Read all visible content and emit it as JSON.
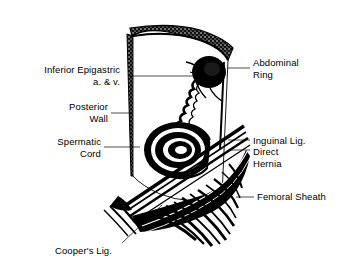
{
  "figure": {
    "background": "#ffffff",
    "ink": "#000000"
  },
  "labels": {
    "inferior_epigastric": "Inferior Epigastric\na. & v.",
    "posterior_wall": "Posterior\nWall",
    "spermatic_cord": "Spermatic\nCord",
    "abdominal_ring": "Abdominal\nRing",
    "inguinal_lig": "Inguinal Lig.",
    "direct_hernia": "Direct\nHernia",
    "femoral_sheath": "Femoral Sheath",
    "coopers_lig": "Cooper's Lig."
  },
  "structures": [
    {
      "name": "posterior-wall-panel",
      "description": "cut abdominal wall flap with stippled cut edge"
    },
    {
      "name": "abdominal-ring",
      "description": "dark filled oval aperture in upper wall"
    },
    {
      "name": "inferior-epigastric-vessels",
      "description": "wavy vessel pair running down the wall"
    },
    {
      "name": "direct-hernia-bulge",
      "description": "concentric swirl below the ring"
    },
    {
      "name": "inguinal-ligament",
      "description": "diagonal banded cord crossing the field"
    },
    {
      "name": "femoral-sheath",
      "description": "fan of fibrous striations lower right"
    },
    {
      "name": "coopers-ligament",
      "description": "pectineal ligament at lower margin"
    }
  ]
}
